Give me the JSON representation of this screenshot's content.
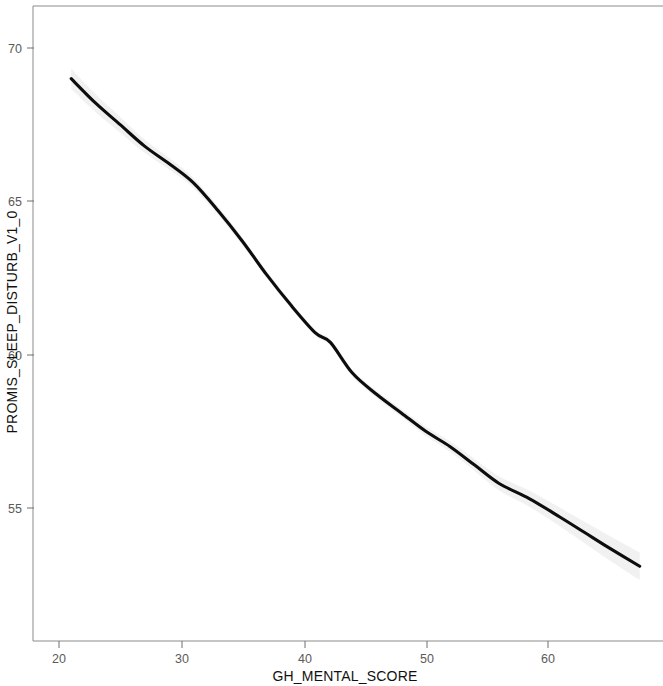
{
  "chart_data": {
    "type": "line",
    "title": "",
    "subtitle": "",
    "xlabel": "GH_MENTAL_SCORE",
    "ylabel": "PROMIS_SLEEP_DISTURB_V1_0",
    "xlim": [
      18.5,
      69.5
    ],
    "ylim": [
      51.8,
      71.2
    ],
    "xticks": [
      20,
      30,
      40,
      50,
      60
    ],
    "xtick_labels": [
      "20",
      "30",
      "40",
      "50",
      "60"
    ],
    "yticks": [
      55,
      60,
      65,
      70
    ],
    "ytick_labels": [
      "55",
      "60",
      "65",
      "70"
    ],
    "grid": false,
    "legend": "none",
    "series": [
      {
        "name": "smoothed fit",
        "x": [
          21.0,
          23.0,
          25.0,
          27.0,
          29.1,
          31.0,
          33.0,
          35.0,
          37.0,
          39.0,
          41.0,
          42.2,
          44.0,
          46.0,
          48.0,
          50.0,
          52.0,
          54.0,
          56.0,
          58.5,
          61.0,
          63.0,
          65.0,
          67.5
        ],
        "y": [
          69.0,
          68.2,
          67.5,
          66.8,
          66.2,
          65.6,
          64.7,
          63.7,
          62.6,
          61.6,
          60.7,
          60.4,
          59.4,
          58.7,
          58.1,
          57.5,
          57.0,
          56.4,
          55.8,
          55.3,
          54.7,
          54.2,
          53.7,
          53.1
        ]
      }
    ],
    "confidence_band": {
      "visible": true,
      "color": "#d9d9d9",
      "description": "faint light-grey confidence band hugging the fitted line"
    },
    "line_color": "#0d0d0d",
    "background_color": "#ffffff",
    "frame_color": "#8b8b8b"
  },
  "axes": {
    "x_axis_title": "GH_MENTAL_SCORE",
    "y_axis_title": "PROMIS_SLEEP_DISTURB_V1_0"
  }
}
